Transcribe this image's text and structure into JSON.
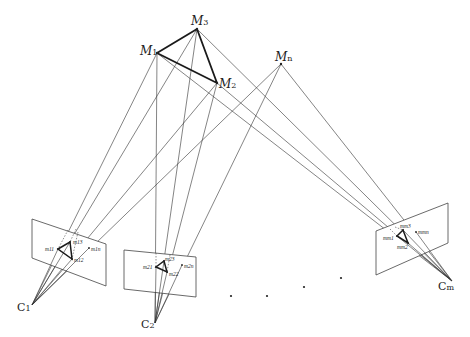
{
  "diagram": {
    "type": "multi-view projection diagram",
    "points_3d": [
      {
        "id": "M1",
        "label_main": "M",
        "label_sub": "1",
        "x": 157,
        "y": 53
      },
      {
        "id": "M2",
        "label_main": "M",
        "label_sub": "2",
        "x": 217,
        "y": 83
      },
      {
        "id": "M3",
        "label_main": "M",
        "label_sub": "3",
        "x": 197,
        "y": 29
      },
      {
        "id": "Mn",
        "label_main": "M",
        "label_sub": "n",
        "x": 281,
        "y": 64
      }
    ],
    "cameras": [
      {
        "id": "C1",
        "label_main": "C",
        "label_sub": "1",
        "x": 32,
        "y": 305
      },
      {
        "id": "C2",
        "label_main": "C",
        "label_sub": "2",
        "x": 155,
        "y": 323
      },
      {
        "id": "Cm",
        "label_main": "C",
        "label_sub": "m",
        "x": 452,
        "y": 281
      }
    ],
    "image_planes": [
      {
        "id": "plane-1",
        "corners": [
          [
            32,
            219
          ],
          [
            106,
            244
          ],
          [
            106,
            286
          ],
          [
            32,
            258
          ]
        ],
        "projections": [
          {
            "label": "m11",
            "x": 58,
            "y": 249
          },
          {
            "label": "m13",
            "x": 70,
            "y": 242
          },
          {
            "label": "m12",
            "x": 72,
            "y": 259
          },
          {
            "label": "m1n",
            "x": 89,
            "y": 248
          }
        ]
      },
      {
        "id": "plane-2",
        "corners": [
          [
            124,
            250
          ],
          [
            196,
            257
          ],
          [
            196,
            297
          ],
          [
            124,
            289
          ]
        ],
        "projections": [
          {
            "label": "m21",
            "x": 156,
            "y": 267
          },
          {
            "label": "m23",
            "x": 164,
            "y": 261
          },
          {
            "label": "m22",
            "x": 167,
            "y": 272
          },
          {
            "label": "m2n",
            "x": 182,
            "y": 265
          }
        ]
      },
      {
        "id": "plane-m",
        "corners": [
          [
            376,
            231
          ],
          [
            448,
            203
          ],
          [
            448,
            243
          ],
          [
            376,
            275
          ]
        ],
        "projections": [
          {
            "label": "mm1",
            "x": 397,
            "y": 236
          },
          {
            "label": "mm3",
            "x": 403,
            "y": 230
          },
          {
            "label": "mm2",
            "x": 408,
            "y": 243
          },
          {
            "label": "mmn",
            "x": 416,
            "y": 232
          }
        ]
      }
    ],
    "ellipsis_dots": [
      {
        "x": 231,
        "y": 296
      },
      {
        "x": 267,
        "y": 296
      },
      {
        "x": 304,
        "y": 287
      },
      {
        "x": 341,
        "y": 278
      }
    ],
    "labels": {
      "M1": "M1",
      "M2": "M2",
      "M3": "M3",
      "Mn": "Mn",
      "C1": "C1",
      "C2": "C2",
      "Cm": "Cm",
      "m11": "m11",
      "m12": "m12",
      "m13": "m13",
      "m1n": "m1n",
      "m21": "m21",
      "m22": "m22",
      "m23": "m23",
      "m2n": "m2n",
      "mm1": "mm1",
      "mm2": "mm2",
      "mm3": "mm3",
      "mmn": "mmn"
    },
    "colors": {
      "line": "#333333",
      "background": "#ffffff",
      "text": "#222222"
    }
  }
}
